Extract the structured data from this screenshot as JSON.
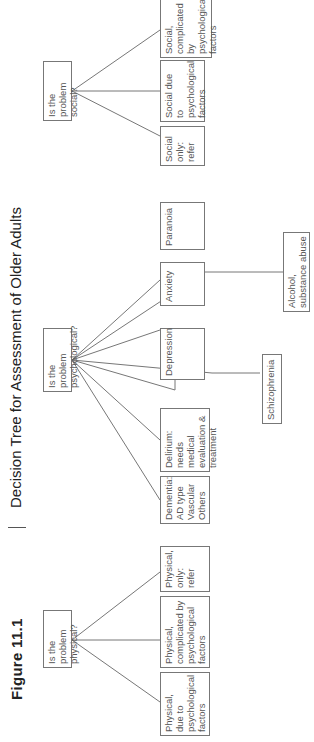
{
  "figure": {
    "label": "Figure 11.1",
    "title": "Decision Tree for Assessment of Older Adults"
  },
  "questions": {
    "physical": {
      "line1": "Is the problem",
      "line2": "physical?"
    },
    "psychological": {
      "line1": "Is the problem",
      "line2": "psychological?"
    },
    "social": {
      "line1": "Is the problem",
      "line2": "social?"
    }
  },
  "physical_leaves": [
    {
      "lines": [
        "Physical,",
        "due to",
        "psychological",
        "factors"
      ]
    },
    {
      "lines": [
        "Physical,",
        "complicated by",
        "psychological",
        "factors"
      ]
    },
    {
      "lines": [
        "Physical,",
        "only:",
        "refer"
      ]
    }
  ],
  "psychological_leaves": [
    {
      "lines": [
        "Dementia:",
        "AD type",
        "Vascular",
        "Others"
      ]
    },
    {
      "lines": [
        "Delirium:",
        "needs medical",
        "evaluation &",
        "treatment"
      ]
    },
    {
      "lines": [
        "Depression"
      ]
    },
    {
      "lines": [
        "Anxiety"
      ]
    },
    {
      "lines": [
        "Paranoia"
      ]
    }
  ],
  "psychological_lower_leaves": [
    {
      "lines": [
        "Schizophrenia"
      ]
    },
    {
      "lines": [
        "Alcohol,",
        "substance abuse"
      ]
    }
  ],
  "social_leaves": [
    {
      "lines": [
        "Social",
        "only:",
        "refer"
      ]
    },
    {
      "lines": [
        "Social due to",
        "psychological",
        "factors"
      ]
    },
    {
      "lines": [
        "Social,",
        "complicated by",
        "psychological",
        "factors"
      ]
    }
  ],
  "colors": {
    "text": "#555555",
    "border": "#777777",
    "heading": "#222222"
  }
}
